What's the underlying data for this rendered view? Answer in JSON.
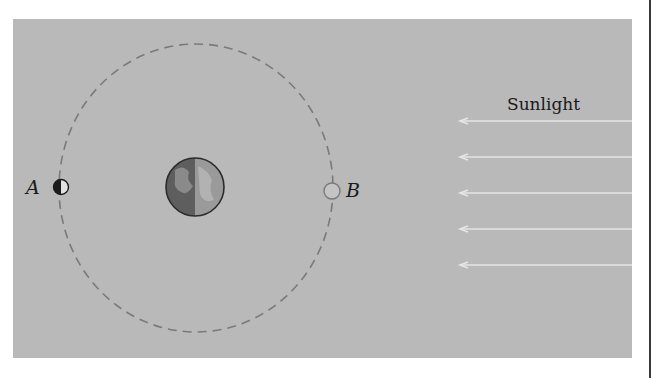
{
  "diagram": {
    "labels": {
      "position_a": "A",
      "position_b": "B",
      "sunlight": "Sunlight"
    },
    "elements": {
      "earth": {
        "description": "Earth, left half dark, right half lit"
      },
      "moon_a": {
        "description": "Moon at position A, left half dark (new/full side phase shown)"
      },
      "moon_b": {
        "description": "Moon at position B, small open circle"
      },
      "orbit": {
        "style": "dashed circle"
      },
      "sunlight_rays": {
        "count": 5,
        "direction": "right-to-left"
      }
    },
    "colors": {
      "background_panel": "#b9b9b9",
      "orbit": "#7a7a7a",
      "rays": "#e6e6e6",
      "text": "#1a1a1a"
    }
  }
}
